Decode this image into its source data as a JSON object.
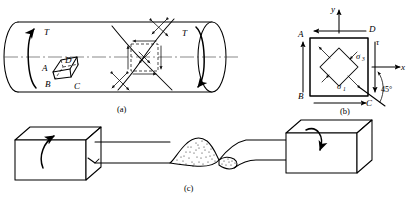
{
  "figure": {
    "background_color": "#ffffff",
    "line_color": "#000000",
    "captions": {
      "a": "(a)",
      "b": "(b)",
      "c": "(c)"
    }
  },
  "panel_a": {
    "caption": "(a)",
    "description": "Circular shaft loaded in torsion with helical crack traces and a surface element",
    "torque_label_left": "T",
    "torque_label_right": "T",
    "element_labels": {
      "A": "A",
      "B": "B",
      "C": "C",
      "D": "D"
    },
    "axis_label": "",
    "features": [
      "left-end-ellipse-cap",
      "right-end-ellipse-cap",
      "centerline",
      "helical-crack-curve-upper",
      "helical-crack-curve-lower",
      "stress-element-square",
      "shear-arrow-pairs"
    ]
  },
  "panel_b": {
    "caption": "(b)",
    "description": "Plane stress element rotated 45 degrees showing principal stresses",
    "axis_labels": {
      "x": "x",
      "y": "y"
    },
    "corner_labels": {
      "A": "A",
      "B": "B",
      "C": "C",
      "D": "D"
    },
    "stress_labels": {
      "shear": "τ",
      "sigma_1": "σ",
      "sigma_1_sub": "1",
      "sigma_3": "σ",
      "sigma_3_sub": "3"
    },
    "angle_label": "45°"
  },
  "panel_c": {
    "caption": "(c)",
    "description": "Two grip blocks twisting a specimen in opposite directions producing a helical fracture",
    "left_block_rotation": "counterclockwise",
    "right_block_rotation": "clockwise",
    "fracture_label": ""
  }
}
